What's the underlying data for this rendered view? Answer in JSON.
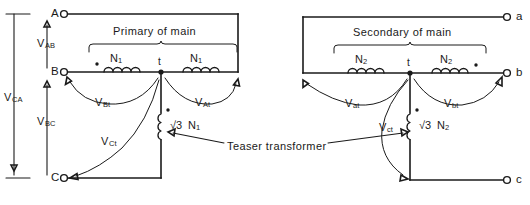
{
  "figure": {
    "type": "electrical-schematic",
    "background_color": "#ffffff",
    "line_color": "#1a1a1a"
  },
  "left_section": {
    "title": "Primary of main",
    "terminals": [
      {
        "id": "A",
        "label": "A"
      },
      {
        "id": "B",
        "label": "B"
      },
      {
        "id": "C",
        "label": "C"
      }
    ],
    "center_tap_label": "t",
    "windings": [
      {
        "id": "n1-left",
        "label": "N",
        "sub": "1"
      },
      {
        "id": "n1-right",
        "label": "N",
        "sub": "1"
      }
    ],
    "teaser_winding": {
      "prefix": "√3",
      "label": "N",
      "sub": "1"
    },
    "voltages": [
      {
        "id": "vab",
        "label": "V",
        "sub": "AB"
      },
      {
        "id": "vbc",
        "label": "V",
        "sub": "BC"
      },
      {
        "id": "vca",
        "label": "V",
        "sub": "CA"
      },
      {
        "id": "vbt",
        "label": "V",
        "sub": "Bt"
      },
      {
        "id": "vat",
        "label": "V",
        "sub": "At"
      },
      {
        "id": "vct",
        "label": "V",
        "sub": "Ct"
      }
    ]
  },
  "right_section": {
    "title": "Secondary of main",
    "terminals": [
      {
        "id": "a",
        "label": "a"
      },
      {
        "id": "b",
        "label": "b"
      },
      {
        "id": "c",
        "label": "c"
      }
    ],
    "center_tap_label": "t",
    "windings": [
      {
        "id": "n2-left",
        "label": "N",
        "sub": "2"
      },
      {
        "id": "n2-right",
        "label": "N",
        "sub": "2"
      }
    ],
    "teaser_winding": {
      "prefix": "√3",
      "label": "N",
      "sub": "2"
    },
    "voltages": [
      {
        "id": "vat2",
        "label": "V",
        "sub": "at"
      },
      {
        "id": "vbt2",
        "label": "V",
        "sub": "bt"
      },
      {
        "id": "vct2",
        "label": "V",
        "sub": "ct"
      }
    ]
  },
  "annotation": {
    "teaser_label": "Teaser transformer"
  }
}
